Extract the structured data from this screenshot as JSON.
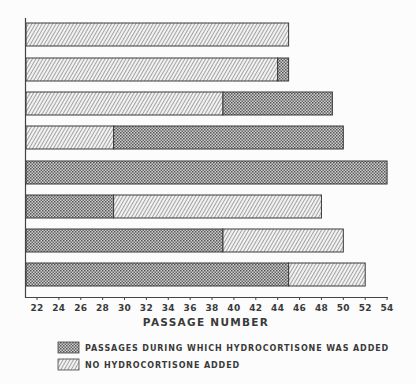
{
  "chart_data": {
    "type": "bar",
    "orientation": "horizontal",
    "stacked": true,
    "title": "",
    "xlabel": "PASSAGE NUMBER",
    "ylabel": "",
    "xlim": [
      21,
      54
    ],
    "x_ticks": [
      22,
      24,
      26,
      28,
      30,
      32,
      34,
      36,
      38,
      40,
      42,
      44,
      46,
      48,
      50,
      52,
      54
    ],
    "grid": false,
    "legend_position": "bottom",
    "legend": [
      {
        "key": "hc",
        "label": "PASSAGES DURING WHICH HYDROCORTISONE WAS ADDED",
        "pattern": "crosshatch"
      },
      {
        "key": "no",
        "label": "NO HYDROCORTISONE ADDED",
        "pattern": "diagonal"
      }
    ],
    "bars": [
      {
        "segments": [
          {
            "type": "no",
            "start": 21,
            "end": 45
          }
        ]
      },
      {
        "segments": [
          {
            "type": "no",
            "start": 21,
            "end": 44
          },
          {
            "type": "hc",
            "start": 44,
            "end": 45
          }
        ]
      },
      {
        "segments": [
          {
            "type": "no",
            "start": 21,
            "end": 39
          },
          {
            "type": "hc",
            "start": 39,
            "end": 49
          }
        ]
      },
      {
        "segments": [
          {
            "type": "no",
            "start": 21,
            "end": 29
          },
          {
            "type": "hc",
            "start": 29,
            "end": 50
          }
        ]
      },
      {
        "segments": [
          {
            "type": "hc",
            "start": 21,
            "end": 54
          }
        ]
      },
      {
        "segments": [
          {
            "type": "hc",
            "start": 21,
            "end": 29
          },
          {
            "type": "no",
            "start": 29,
            "end": 48
          }
        ]
      },
      {
        "segments": [
          {
            "type": "hc",
            "start": 21,
            "end": 39
          },
          {
            "type": "no",
            "start": 39,
            "end": 50
          }
        ]
      },
      {
        "segments": [
          {
            "type": "hc",
            "start": 21,
            "end": 45
          },
          {
            "type": "no",
            "start": 45,
            "end": 52
          }
        ]
      }
    ]
  },
  "colors": {
    "ink": "#333333",
    "background": "#fcfcfc"
  }
}
